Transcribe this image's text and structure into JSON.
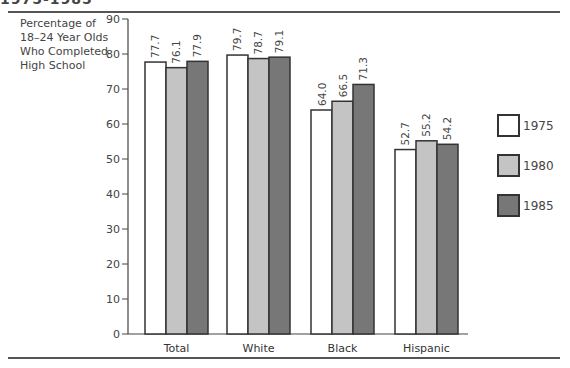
{
  "header": {
    "partial_title": "1975-1985"
  },
  "chart_data": {
    "type": "bar",
    "title": "",
    "ylabel": "Percentage of 18–24 Year Olds Who Completed High School",
    "ylabel_lines": [
      "Percentage of",
      "18–24 Year Olds",
      "Who Completed",
      "High School"
    ],
    "xlabel": "",
    "categories": [
      "Total",
      "White",
      "Black",
      "Hispanic"
    ],
    "series": [
      {
        "name": "1975",
        "color": "#ffffff",
        "values": [
          77.7,
          79.7,
          64.0,
          52.7
        ]
      },
      {
        "name": "1980",
        "color": "#c4c4c4",
        "values": [
          76.1,
          78.7,
          66.5,
          55.2
        ]
      },
      {
        "name": "1985",
        "color": "#777777",
        "values": [
          77.9,
          79.1,
          71.3,
          54.2
        ]
      }
    ],
    "ylim": [
      0,
      90
    ],
    "yticks": [
      0,
      10,
      20,
      30,
      40,
      50,
      60,
      70,
      80,
      90
    ],
    "grid": false,
    "legend_position": "right",
    "data_labels": true
  }
}
